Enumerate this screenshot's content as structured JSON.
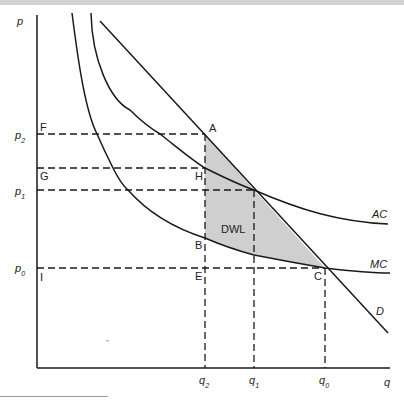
{
  "diagram": {
    "type": "economics-deadweight-loss",
    "axes": {
      "y_label": "p",
      "x_label": "q"
    },
    "price_levels": [
      {
        "label": "p",
        "sub": "2",
        "point_label": "F"
      },
      {
        "label": "p",
        "sub": "1",
        "point_label": "G"
      },
      {
        "label": "p",
        "sub": "0",
        "point_label": "I"
      }
    ],
    "quantity_levels": [
      {
        "label": "q",
        "sub": "2"
      },
      {
        "label": "q",
        "sub": "1"
      },
      {
        "label": "q",
        "sub": "0"
      }
    ],
    "curves": {
      "ac": "AC",
      "mc": "MC",
      "demand": "D"
    },
    "points": {
      "a": "A",
      "h": "H",
      "b": "B",
      "e": "E",
      "c": "C",
      "f": "F",
      "g": "G",
      "i": "I"
    },
    "shaded_region_label": "DWL",
    "colors": {
      "line": "#1a1a1a",
      "shade": "#cfcfcf"
    }
  }
}
